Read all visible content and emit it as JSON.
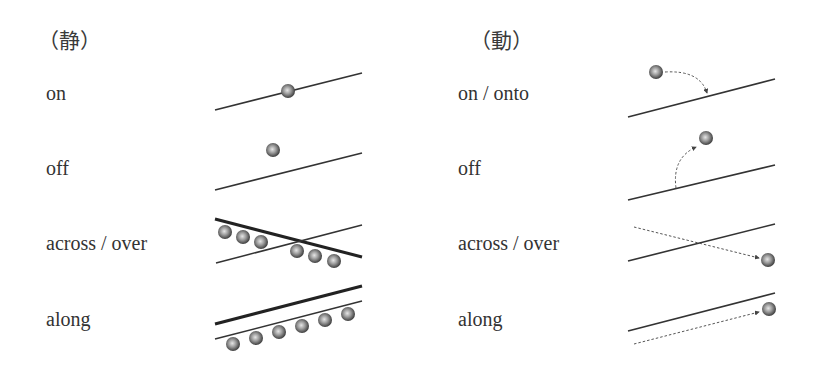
{
  "columns": [
    {
      "heading": "（静）",
      "rows": [
        {
          "label": "on"
        },
        {
          "label": "off"
        },
        {
          "label": "across / over"
        },
        {
          "label": "along"
        }
      ]
    },
    {
      "heading": "（動）",
      "rows": [
        {
          "label": "on / onto"
        },
        {
          "label": "off"
        },
        {
          "label": "across / over"
        },
        {
          "label": "along"
        }
      ]
    }
  ],
  "colors": {
    "line": "#333333",
    "ball_dark": "#3a3a3a",
    "ball_light": "#d8d8d8",
    "dashed": "#555555"
  }
}
